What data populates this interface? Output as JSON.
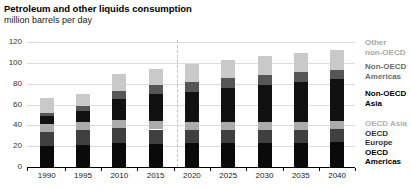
{
  "chart_data": {
    "type": "bar",
    "stacked": true,
    "title": "Petroleum and other liquids consumption",
    "subtitle": "million barrels per day",
    "unit": "million barrels per day",
    "categories": [
      "1990",
      "1995",
      "2010",
      "2015",
      "2020",
      "2025",
      "2030",
      "2035",
      "2040"
    ],
    "series": [
      {
        "name": "OECD Americas",
        "color": "#0a0a0a",
        "values": [
          20.5,
          21.5,
          23.0,
          22.0,
          23.0,
          23.0,
          23.0,
          23.0,
          24.0
        ]
      },
      {
        "name": "OECD Europe",
        "color": "#404040",
        "values": [
          13.0,
          14.0,
          14.5,
          14.0,
          12.5,
          12.5,
          12.5,
          12.5,
          12.5
        ]
      },
      {
        "name": "OECD Asia",
        "color": "#ababab",
        "values": [
          7.5,
          8.0,
          8.0,
          8.5,
          8.0,
          8.0,
          8.0,
          8.0,
          8.0
        ]
      },
      {
        "name": "Non-OECD Asia",
        "color": "#111111",
        "values": [
          7.5,
          10.5,
          20.0,
          25.5,
          28.5,
          32.0,
          35.0,
          38.0,
          40.0
        ]
      },
      {
        "name": "Non-OECD Americas",
        "color": "#565656",
        "values": [
          3.5,
          4.5,
          7.0,
          9.0,
          9.5,
          9.5,
          9.5,
          9.5,
          9.0
        ]
      },
      {
        "name": "Other non-OECD",
        "color": "#c9c9c9",
        "values": [
          14.5,
          12.0,
          16.5,
          15.5,
          17.0,
          18.0,
          18.5,
          18.5,
          19.0
        ]
      }
    ],
    "totals": [
      66.5,
      70.5,
      89.0,
      94.5,
      98.5,
      103.0,
      106.5,
      109.5,
      112.5
    ],
    "ylim": [
      0,
      120
    ],
    "yticks": [
      0,
      20,
      40,
      60,
      80,
      100,
      120
    ],
    "grid": "horizontal",
    "history_divider_after_category": "2015",
    "legend_position": "right",
    "legend": [
      {
        "lines": [
          "Other",
          "non-OECD"
        ],
        "series": "Other non-OECD",
        "color": "#a8a8a8"
      },
      {
        "lines": [
          "Non-OECD",
          "Americas"
        ],
        "series": "Non-OECD Americas",
        "color": "#6b6b6b"
      },
      {
        "lines": [
          "Non-OECD",
          "Asia"
        ],
        "series": "Non-OECD Asia",
        "color": "#000000"
      },
      {
        "lines": [
          "OECD Asia"
        ],
        "series": "OECD Asia",
        "color": "#b0b0b0"
      },
      {
        "lines": [
          "OECD",
          "Europe"
        ],
        "series": "OECD Europe",
        "color": "#333333"
      },
      {
        "lines": [
          "OECD",
          "Americas"
        ],
        "series": "OECD Americas",
        "color": "#000000"
      }
    ]
  }
}
